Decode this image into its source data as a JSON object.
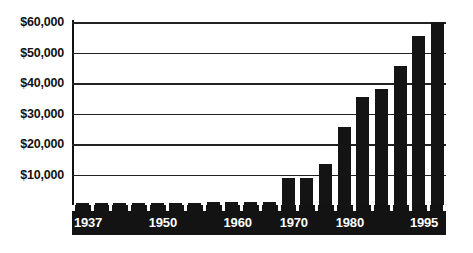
{
  "chart_data": {
    "type": "bar",
    "title": "",
    "subtitle": "",
    "xlabel": "",
    "ylabel": "",
    "ylim": [
      0,
      60000
    ],
    "grid": true,
    "legend": null,
    "y_ticks": [
      {
        "value": 60000,
        "label": "$60,000"
      },
      {
        "value": 50000,
        "label": "$50,000"
      },
      {
        "value": 40000,
        "label": "$40,000"
      },
      {
        "value": 30000,
        "label": "$30,000"
      },
      {
        "value": 20000,
        "label": "$20,000"
      },
      {
        "value": 10000,
        "label": "$10,000"
      }
    ],
    "x_tick_labels": [
      {
        "index": 0,
        "label": "1937"
      },
      {
        "index": 4,
        "label": "1950"
      },
      {
        "index": 8,
        "label": "1960"
      },
      {
        "index": 11,
        "label": "1970"
      },
      {
        "index": 14,
        "label": "1980"
      },
      {
        "index": 19,
        "label": "1995"
      }
    ],
    "categories": [
      "1937",
      "1940",
      "1944",
      "1947",
      "1950",
      "1953",
      "1956",
      "1958",
      "1960",
      "1963",
      "1966",
      "1970",
      "1973",
      "1976",
      "1980",
      "1983",
      "1986",
      "1989",
      "1992",
      "1995"
    ],
    "values": [
      700,
      700,
      700,
      700,
      700,
      800,
      800,
      900,
      1000,
      1000,
      1100,
      9000,
      9000,
      13500,
      25500,
      35500,
      38000,
      45500,
      55500,
      60000
    ],
    "bar_color": "#141414",
    "axis_band_color": "#131313",
    "gridline_color": "#222222",
    "background_color": "#ffffff"
  }
}
